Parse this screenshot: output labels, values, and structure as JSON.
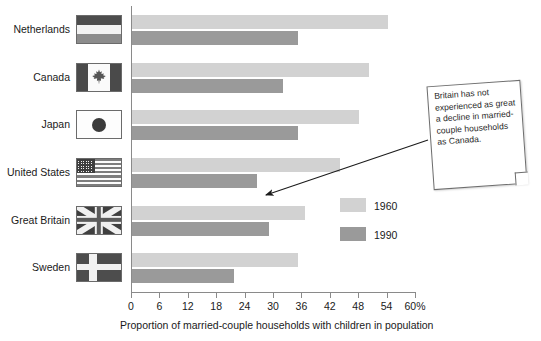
{
  "chart_data": {
    "type": "bar",
    "orientation": "horizontal",
    "title": "",
    "xlabel": "Proportion of married-couple households with children in population",
    "ylabel": "",
    "categories": [
      "Netherlands",
      "Canada",
      "Japan",
      "United States",
      "Great Britain",
      "Sweden"
    ],
    "series": [
      {
        "name": "1960",
        "color": "#d2d2d2",
        "values": [
          54,
          50,
          48,
          44,
          36.5,
          35
        ]
      },
      {
        "name": "1990",
        "color": "#9a9a9a",
        "values": [
          35,
          32,
          35,
          26.5,
          29,
          21.5
        ]
      }
    ],
    "xlim": [
      0,
      60
    ],
    "xticks": [
      0,
      6,
      12,
      18,
      24,
      30,
      36,
      42,
      48,
      54,
      60
    ],
    "xtick_labels": [
      "0",
      "6",
      "12",
      "18",
      "24",
      "30",
      "36",
      "42",
      "48",
      "54",
      "60%"
    ],
    "grid": false,
    "legend_position": "center-right",
    "annotations": [
      {
        "text": "Britain has not experienced as great a decline in married-couple households as Canada.",
        "points_to": "Great Britain"
      }
    ]
  },
  "flags": {
    "Netherlands": "flag-netherlands-icon",
    "Canada": "flag-canada-icon",
    "Japan": "flag-japan-icon",
    "United States": "flag-united-states-icon",
    "Great Britain": "flag-great-britain-icon",
    "Sweden": "flag-sweden-icon"
  }
}
